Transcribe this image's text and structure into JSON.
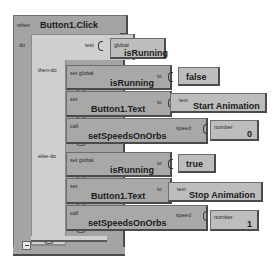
{
  "event": {
    "keyword": "when",
    "name": "Button1.Click",
    "do_label": "do"
  },
  "ifelse": {
    "name": "ifelse",
    "test_label": "test",
    "test_value": {
      "scope": "global",
      "variable": "isRunning"
    },
    "then_label": "then-do",
    "else_label": "else-do"
  },
  "then_branch": [
    {
      "keyword": "set global",
      "target": "isRunning",
      "to_label": "to",
      "value_type": "",
      "value": "false"
    },
    {
      "keyword": "set",
      "target": "Button1.Text",
      "to_label": "to",
      "value_type": "text",
      "value": "Start Animation"
    },
    {
      "keyword": "call",
      "target": "setSpeedsOnOrbs",
      "to_label": "speed",
      "value_type": "number",
      "value": "0"
    }
  ],
  "else_branch": [
    {
      "keyword": "set global",
      "target": "isRunning",
      "to_label": "to",
      "value_type": "",
      "value": "true"
    },
    {
      "keyword": "set",
      "target": "Button1.Text",
      "to_label": "to",
      "value_type": "text",
      "value": "Stop Animation"
    },
    {
      "keyword": "call",
      "target": "setSpeedsOnOrbs",
      "to_label": "speed",
      "value_type": "number",
      "value": "1"
    }
  ],
  "colors": {
    "event_block": "#a4a4a4",
    "control_block": "#cfcfcf",
    "statement_block": "#a8a8a8",
    "value_block": "#bdbdbd",
    "canvas": "#ffffff"
  }
}
